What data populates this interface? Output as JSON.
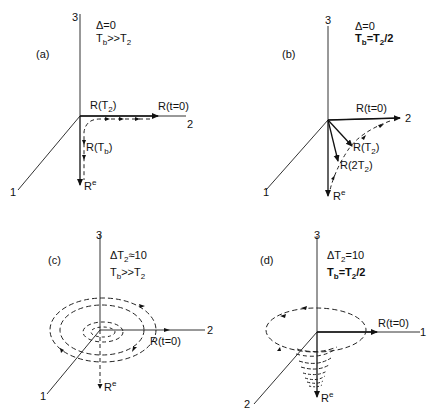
{
  "figure": {
    "panels": [
      {
        "id": "a",
        "label": "(a)",
        "params": [
          "Δ=0",
          "Tb>>T2"
        ],
        "param_lines": {
          "line1": "Δ=0",
          "line2_base": "T",
          "line2_sub": "b",
          "line2_mid": ">>T",
          "line2_sub2": "2"
        },
        "axes": {
          "vertical": "3",
          "right": "2",
          "diag": "1"
        },
        "vectors": {
          "t0": "R(t=0)",
          "T2_base": "R(T",
          "T2_sub": "2",
          "Tb_base": "R(T",
          "Tb_sub": "b",
          "Re_base": "R",
          "Re_sup": "e"
        }
      },
      {
        "id": "b",
        "label": "(b)",
        "params": [
          "Δ=0",
          "Tb=T2/2"
        ],
        "param_lines": {
          "line1": "Δ=0",
          "line2_base": "T",
          "line2_sub": "b",
          "line2_mid": "=T",
          "line2_sub2": "2",
          "line2_tail": "/2"
        },
        "axes": {
          "vertical": "3",
          "right": "2",
          "diag": "1"
        },
        "vectors": {
          "t0": "R(t=0)",
          "T2_base": "R(T",
          "T2_sub": "2",
          "twoT2_base": "R(2T",
          "twoT2_sub": "2",
          "Re_base": "R",
          "Re_sup": "e"
        }
      },
      {
        "id": "c",
        "label": "(c)",
        "params": [
          "ΔT2≈10",
          "Tb>>T2"
        ],
        "param_lines": {
          "line1_base": "ΔT",
          "line1_sub": "2",
          "line1_tail": "≈10",
          "line2_base": "T",
          "line2_sub": "b",
          "line2_mid": ">>T",
          "line2_sub2": "2"
        },
        "axes": {
          "vertical": "3",
          "right": "2",
          "diag": "1"
        },
        "vectors": {
          "t0": "R(t=0)",
          "Re_base": "R",
          "Re_sup": "e"
        }
      },
      {
        "id": "d",
        "label": "(d)",
        "params": [
          "ΔT2=10",
          "Tb=T2/2"
        ],
        "param_lines": {
          "line1_base": "ΔT",
          "line1_sub": "2",
          "line1_tail": "=10",
          "line2_base": "T",
          "line2_sub": "b",
          "line2_mid": "=T",
          "line2_sub2": "2",
          "line2_tail": "/2"
        },
        "axes": {
          "vertical": "3",
          "right": "1",
          "diag": "2"
        },
        "vectors": {
          "t0": "R(t=0)",
          "Re_base": "R",
          "Re_sup": "e"
        }
      }
    ]
  }
}
